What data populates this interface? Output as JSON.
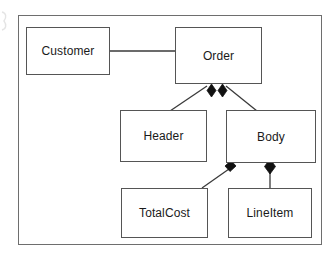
{
  "diagram": {
    "type": "uml-class-diagram",
    "title": "",
    "frame": {
      "x": 18,
      "y": 15,
      "width": 304,
      "height": 230
    },
    "colors": {
      "background": "#ffffff",
      "box_fill": "#ffffff",
      "box_stroke": "#555555",
      "frame_stroke": "#6e6e6e",
      "line_stroke": "#3a3a3a",
      "diamond_fill": "#111111",
      "text": "#1a1a1a"
    },
    "classes": [
      {
        "id": "customer",
        "label": "Customer",
        "x": 26,
        "y": 27,
        "width": 84,
        "height": 48
      },
      {
        "id": "order",
        "label": "Order",
        "x": 175,
        "y": 27,
        "width": 87,
        "height": 57
      },
      {
        "id": "header",
        "label": "Header",
        "x": 120,
        "y": 110,
        "width": 87,
        "height": 52
      },
      {
        "id": "body",
        "label": "Body",
        "x": 226,
        "y": 110,
        "width": 90,
        "height": 53
      },
      {
        "id": "totalcost",
        "label": "TotalCost",
        "x": 121,
        "y": 188,
        "width": 87,
        "height": 50
      },
      {
        "id": "lineitem",
        "label": "LineItem",
        "x": 228,
        "y": 188,
        "width": 84,
        "height": 50
      }
    ],
    "relationships": [
      {
        "id": "customer-order",
        "kind": "association",
        "from": "customer",
        "to": "order",
        "adornment": "none",
        "path": "M110,51 L175,51"
      },
      {
        "id": "order-header",
        "kind": "composition",
        "from": "order",
        "to": "header",
        "adornment": "filled-diamond",
        "diamond_at": "order",
        "path": "M209,88 L170,110"
      },
      {
        "id": "order-body",
        "kind": "composition",
        "from": "order",
        "to": "body",
        "adornment": "filled-diamond",
        "diamond_at": "order",
        "path": "M224,88 L256,110"
      },
      {
        "id": "body-totalcost",
        "kind": "composition",
        "from": "body",
        "to": "totalcost",
        "adornment": "filled-diamond",
        "diamond_at": "body",
        "path": "M231,168 L200,188"
      },
      {
        "id": "body-lineitem",
        "kind": "composition",
        "from": "body",
        "to": "lineitem",
        "adornment": "filled-diamond",
        "diamond_at": "body",
        "path": "M270,170 L270,188"
      }
    ]
  }
}
